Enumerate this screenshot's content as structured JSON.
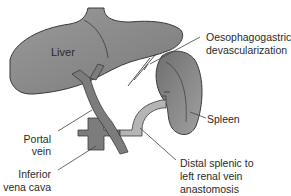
{
  "diagram": {
    "labels": {
      "liver": "Liver",
      "oesophagogastric_line1": "Oesophagogastric",
      "oesophagogastric_line2": "devascularization",
      "spleen": "Spleen",
      "portal_line1": "Portal",
      "portal_line2": "vein",
      "ivc_line1": "Inferior",
      "ivc_line2": "vena cava",
      "distal_line1": "Distal splenic to",
      "distal_line2": "left renal vein",
      "distal_line3": "anastomosis"
    },
    "colors": {
      "organ_fill": "#8a8a8a",
      "organ_shade": "#6e6e6e",
      "vessel_fill": "#7c7c7c",
      "vein_light": "#b5b5b5",
      "outline": "#3a3a3a",
      "text": "#2a2a2a"
    }
  }
}
